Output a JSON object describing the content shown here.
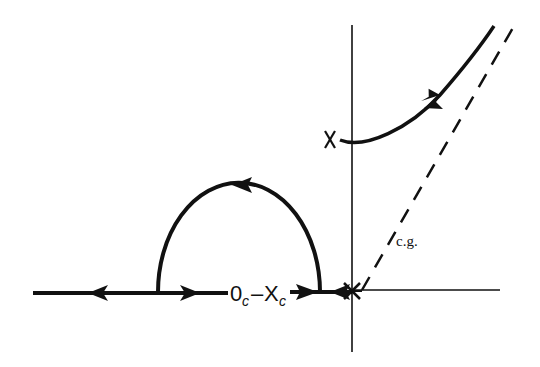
{
  "diagram": {
    "type": "root-locus",
    "labels": {
      "pole_marker": "X",
      "zero_pole_pair_main_0": "0",
      "zero_pole_pair_sub_0": "c",
      "zero_pole_pair_dash": "–",
      "zero_pole_pair_main_x": "X",
      "zero_pole_pair_sub_x": "c",
      "asymptote": "c.g."
    },
    "colors": {
      "stroke": "#111111",
      "background": "#ffffff"
    },
    "elements": [
      "real-axis",
      "imaginary-axis",
      "real-axis-locus-segment",
      "semicircular-breakaway-locus",
      "complex-pole-branch",
      "dashed-asymptote",
      "origin-pole-cluster"
    ]
  }
}
